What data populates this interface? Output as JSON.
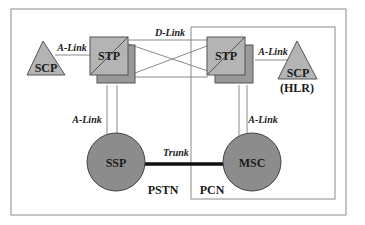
{
  "diagram": {
    "colors": {
      "frame": "#8a8a8a",
      "node_fill": "#b4b4b4",
      "node_shadow": "#999999",
      "circle_fill": "#8c8c8c",
      "trunk": "#111111",
      "text": "#1a1a1a"
    },
    "nodes": {
      "scp_left": {
        "label": "SCP"
      },
      "stp_left": {
        "label": "STP"
      },
      "stp_right": {
        "label": "STP"
      },
      "scp_right": {
        "label": "SCP",
        "sublabel": "(HLR)"
      },
      "ssp": {
        "label": "SSP"
      },
      "msc": {
        "label": "MSC"
      }
    },
    "links": {
      "a_link_top_left": "A-Link",
      "a_link_top_right": "A-Link",
      "d_link": "D-Link",
      "a_link_bottom_left": "A-Link",
      "a_link_bottom_right": "A-Link",
      "trunk": "Trunk"
    },
    "regions": {
      "pstn": "PSTN",
      "pcn": "PCN"
    }
  }
}
